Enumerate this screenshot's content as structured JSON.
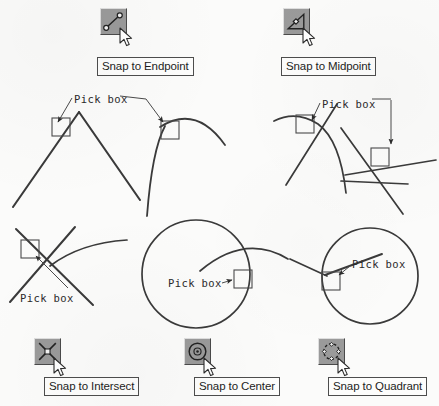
{
  "page": {
    "background_color": "#fbfbfa",
    "ink_color": "#333333"
  },
  "toolbar_buttons": [
    {
      "id": "endpoint",
      "icon_name": "snap-endpoint-icon",
      "caption": "Snap to Endpoint",
      "icon_x": 100,
      "icon_y": 8,
      "caption_x": 97,
      "caption_y": 57,
      "cursor_x": 119,
      "cursor_y": 27
    },
    {
      "id": "midpoint",
      "icon_name": "snap-midpoint-icon",
      "caption": "Snap to Midpoint",
      "icon_x": 283,
      "icon_y": 8,
      "caption_x": 281,
      "caption_y": 57,
      "cursor_x": 302,
      "cursor_y": 27
    },
    {
      "id": "intersect",
      "icon_name": "snap-intersect-icon",
      "caption": "Snap to Intersect",
      "icon_x": 34,
      "icon_y": 338,
      "caption_x": 44,
      "caption_y": 377,
      "cursor_x": 53,
      "cursor_y": 357
    },
    {
      "id": "center",
      "icon_name": "snap-center-icon",
      "caption": "Snap to Center",
      "icon_x": 184,
      "icon_y": 338,
      "caption_x": 194,
      "caption_y": 377,
      "cursor_x": 203,
      "cursor_y": 357
    },
    {
      "id": "quadrant",
      "icon_name": "snap-quadrant-icon",
      "caption": "Snap to Quadrant",
      "icon_x": 318,
      "icon_y": 338,
      "caption_x": 328,
      "caption_y": 377,
      "cursor_x": 337,
      "cursor_y": 357
    }
  ],
  "annotations": [
    {
      "id": "pick-box-endpoint",
      "text": "Pick  box",
      "x": 74,
      "y": 93
    },
    {
      "id": "pick-box-midpoint",
      "text": "Pick  box",
      "x": 322,
      "y": 105
    },
    {
      "id": "pick-box-intersect",
      "text": "Pick  box",
      "x": 20,
      "y": 292
    },
    {
      "id": "pick-box-center",
      "text": "Pick  box",
      "x": 168,
      "y": 285
    },
    {
      "id": "pick-box-quadrant",
      "text": "Pick  box",
      "x": 352,
      "y": 264
    }
  ],
  "pick_boxes": [
    {
      "id": "pickbox-endpoint",
      "x": 52,
      "y": 118,
      "size": 18
    },
    {
      "id": "pickbox-midpoint-arc",
      "x": 161,
      "y": 121,
      "size": 18
    },
    {
      "id": "pickbox-arc-line",
      "x": 296,
      "y": 115,
      "size": 18
    },
    {
      "id": "pickbox-two-lines",
      "x": 371,
      "y": 148,
      "size": 18
    },
    {
      "id": "pickbox-intersect",
      "x": 21,
      "y": 240,
      "size": 18
    },
    {
      "id": "pickbox-center",
      "x": 234,
      "y": 270,
      "size": 18
    },
    {
      "id": "pickbox-quadrant",
      "x": 322,
      "y": 272,
      "size": 18
    }
  ],
  "figures": {
    "endpoint_vee": "two lines meeting at an apex with pick box on left leg near apex",
    "midpoint_arc": "vertical line with arc curving right, pick box at junction",
    "arc_line_intersection": "horizontal arc crossing a diagonal line, pick box at crossing",
    "two_line_intersection": "two diagonal lines crossing, pick box at crossing",
    "intersect_cross": "two lines crossing in an X with a curve, pick box above intersection",
    "center_circle": "large circle with arc tangent, pick box on right edge",
    "quadrant_circle": "circle with chord line entering from left, pick box on left edge"
  }
}
